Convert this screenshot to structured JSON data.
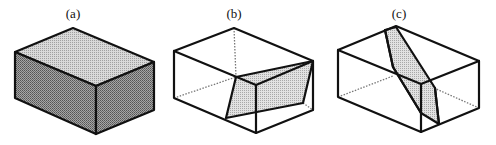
{
  "figure": {
    "panels": [
      {
        "id": "a",
        "label": "(a)",
        "description": "Solid shaded rectangular block"
      },
      {
        "id": "b",
        "label": "(b)",
        "description": "Wireframe block with shaded oblique cut plane near the front-right"
      },
      {
        "id": "c",
        "label": "(c)",
        "description": "Wireframe block with shaded steep diagonal cut plane through the middle"
      }
    ],
    "colors": {
      "edge": "#111111",
      "top_face_shade": "#c8c8c8",
      "side_face_shade": "#8a8a8a",
      "cut_plane_shade": "#cfcfcf",
      "hidden_line": "#777777",
      "background": "#ffffff"
    }
  }
}
